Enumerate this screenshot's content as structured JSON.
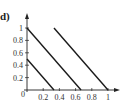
{
  "panel_label": "d)",
  "chart_data": {
    "type": "line",
    "title": "",
    "xlabel": "",
    "ylabel": "",
    "xlim": [
      0,
      1.1
    ],
    "ylim": [
      0,
      1.1
    ],
    "grid": false,
    "legend": null,
    "x_ticks": [
      "0.2",
      "0.4",
      "0.6",
      "0.8",
      "1"
    ],
    "y_ticks": [
      "0.2",
      "0.4",
      "0.6",
      "0.8",
      "1"
    ],
    "origin_label": "0",
    "series": [
      {
        "name": "line1",
        "x": [
          0,
          0.333
        ],
        "y": [
          0.5,
          0
        ]
      },
      {
        "name": "line2",
        "x": [
          0,
          0.667
        ],
        "y": [
          1,
          0
        ]
      },
      {
        "name": "line3",
        "x": [
          0.333,
          1
        ],
        "y": [
          1,
          0
        ]
      }
    ]
  }
}
